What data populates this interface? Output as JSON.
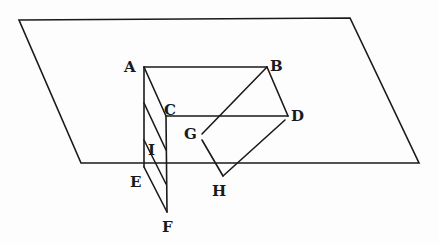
{
  "diagram": {
    "labels": {
      "A": "A",
      "B": "B",
      "C": "C",
      "D": "D",
      "E": "E",
      "F": "F",
      "G": "G",
      "H": "H",
      "I": "I"
    },
    "colors": {
      "ink": "#1a1a1a",
      "paper": "#fdfdfd"
    }
  }
}
